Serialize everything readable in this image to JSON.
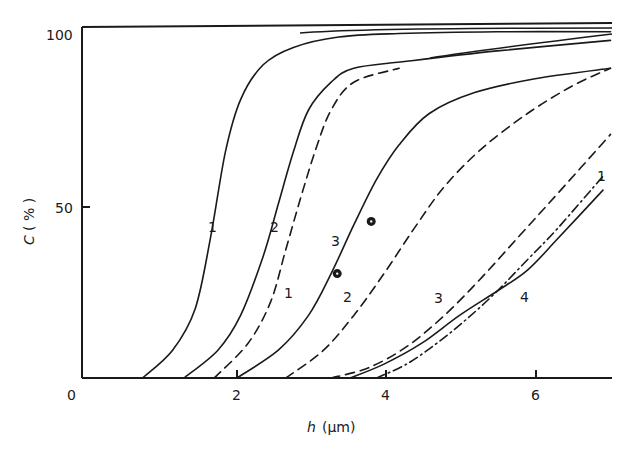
{
  "chart_data": {
    "type": "line",
    "title": "",
    "xlabel": "h (µm)",
    "xlabel_var": "h",
    "xlabel_unit": "(µm)",
    "ylabel": "C (%)",
    "ylabel_var": "C",
    "ylabel_unit": "(%)",
    "xlim": [
      0,
      7.0
    ],
    "ylim": [
      0,
      100
    ],
    "x_ticks": [
      0,
      2,
      4,
      6
    ],
    "x_tick_labels": [
      "0",
      "2",
      "4",
      "6"
    ],
    "y_ticks": [
      50,
      100
    ],
    "y_tick_labels": [
      "50",
      "100"
    ],
    "grid": false,
    "legend": "none (curves labeled inline with numbers 1–4)",
    "series": [
      {
        "name": "1",
        "style": "solid",
        "label": "1",
        "label_pos": [
          1.7,
          55
        ],
        "x": [
          0.8,
          1.2,
          1.5,
          1.7,
          1.9,
          2.1,
          2.4,
          2.8,
          3.4,
          4.2,
          5.5,
          7.0
        ],
        "y": [
          0,
          8,
          20,
          40,
          65,
          80,
          90,
          95,
          98,
          99,
          99.5,
          99.5
        ]
      },
      {
        "name": "2",
        "style": "solid",
        "label": "2",
        "label_pos": [
          2.5,
          55
        ],
        "x": [
          1.35,
          1.8,
          2.1,
          2.4,
          2.6,
          2.8,
          3.0,
          3.3,
          3.6,
          4.3,
          5.5,
          7.0
        ],
        "y": [
          0,
          8,
          18,
          35,
          50,
          65,
          77,
          85,
          89,
          91,
          94,
          97
        ]
      },
      {
        "name": "1'",
        "style": "dashed",
        "label": "1",
        "label_pos": [
          2.7,
          24
        ],
        "x": [
          1.75,
          2.2,
          2.5,
          2.7,
          2.9,
          3.1,
          3.3,
          3.6,
          4.2
        ],
        "y": [
          0,
          10,
          22,
          37,
          52,
          66,
          77,
          85,
          89
        ]
      },
      {
        "name": "3",
        "style": "solid",
        "label": "3",
        "label_pos": [
          3.3,
          38
        ],
        "x": [
          2.05,
          2.6,
          3.0,
          3.3,
          3.6,
          3.9,
          4.2,
          4.6,
          5.2,
          6.0,
          7.0
        ],
        "y": [
          0,
          8,
          18,
          30,
          44,
          57,
          67,
          76,
          82,
          86,
          89
        ]
      },
      {
        "name": "2'",
        "style": "dashed",
        "label": "2",
        "label_pos": [
          3.4,
          22
        ],
        "x": [
          2.7,
          3.2,
          3.6,
          4.0,
          4.4,
          4.8,
          5.3,
          5.9,
          6.5,
          7.0
        ],
        "y": [
          0,
          8,
          18,
          30,
          43,
          55,
          66,
          76,
          84,
          89
        ]
      },
      {
        "name": "3'",
        "style": "dashed",
        "label": "3",
        "label_pos": [
          4.7,
          20
        ],
        "x": [
          3.3,
          3.8,
          4.3,
          4.8,
          5.3,
          5.8,
          6.3,
          7.0
        ],
        "y": [
          0,
          3,
          9,
          18,
          29,
          41,
          53,
          70
        ]
      },
      {
        "name": "1''",
        "style": "dash-dot",
        "label": "1",
        "label_pos": [
          7.0,
          55
        ],
        "x": [
          3.9,
          4.3,
          4.7,
          5.1,
          5.5,
          5.9,
          6.3,
          6.9
        ],
        "y": [
          0,
          4,
          10,
          17,
          25,
          34,
          43,
          58
        ]
      },
      {
        "name": "4",
        "style": "solid",
        "label": "4",
        "label_pos": [
          5.95,
          20
        ],
        "x": [
          3.55,
          4.0,
          4.5,
          5.0,
          5.5,
          5.9,
          6.3,
          6.9
        ],
        "y": [
          0,
          4,
          10,
          18,
          25,
          31,
          40,
          54
        ]
      }
    ],
    "annotations": [
      {
        "type": "marker",
        "shape": "dotted-circle",
        "x": 3.38,
        "y": 30
      },
      {
        "type": "marker",
        "shape": "dotted-circle",
        "x": 3.83,
        "y": 45
      },
      {
        "type": "plateau-lines",
        "note": "Top-right curves converge near 100% with three near-horizontal lines at right edge"
      }
    ]
  },
  "axis_labels": {
    "x_var": "h",
    "x_unit": "(µm)",
    "y_var": "C",
    "y_unit": "( % )",
    "x_tick_0": "0",
    "x_tick_2": "2",
    "x_tick_4": "4",
    "x_tick_6": "6",
    "y_tick_50": "50",
    "y_tick_100": "100"
  },
  "curve_labels": {
    "solid_1": "1",
    "solid_2": "2",
    "dashed_1": "1",
    "solid_3": "3",
    "dashed_2": "2",
    "dashed_3": "3",
    "dashdot_1": "1",
    "solid_4": "4"
  }
}
